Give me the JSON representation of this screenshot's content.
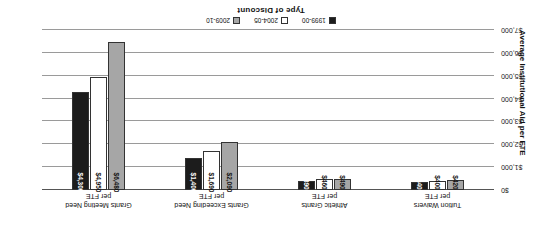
{
  "chart_data": {
    "type": "bar",
    "title": "",
    "xlabel": "Type of Discount",
    "ylabel": "Average Institutional Aid per FTE",
    "orientation": "vertical-grouped",
    "rotated_180": true,
    "grid": true,
    "legend_position": "bottom",
    "ylim": [
      0,
      7000
    ],
    "yticks": [
      0,
      1000,
      2000,
      3000,
      4000,
      5000,
      6000,
      7000
    ],
    "ytick_labels": [
      "$0",
      "$1,000",
      "$2,000",
      "$3,000",
      "$4,000",
      "$5,000",
      "$6,000",
      "$7,000"
    ],
    "categories": [
      "Tuition Waivers\nper FTE",
      "Athletic Grants\nper FTE",
      "Grants Exceeding Need\nper FTE",
      "Grants Meeting Need\nper FTE"
    ],
    "series": [
      {
        "name": "2009-10",
        "color": "#a6a6a6",
        "values": [
          420,
          490,
          2090,
          6480
        ],
        "labels": [
          "$420",
          "$490",
          "$2,090",
          "$6,480"
        ]
      },
      {
        "name": "2004-05",
        "color": "#ffffff",
        "values": [
          400,
          460,
          1690,
          4950
        ],
        "labels": [
          "$400",
          "$460",
          "$1,690",
          "$4,950"
        ]
      },
      {
        "name": "1999-00",
        "color": "#1c1c1c",
        "values": [
          340,
          390,
          1400,
          4300
        ],
        "labels": [
          "$340",
          "$390",
          "$1,400",
          "$4,300"
        ]
      }
    ]
  },
  "axis": {
    "x_title": "Type of Discount",
    "y_title": "Average Institutional Aid per FTE"
  },
  "categories": [
    {
      "line1": "Tuition Waivers",
      "line2": "per FTE"
    },
    {
      "line1": "Athletic Grants",
      "line2": "per FTE"
    },
    {
      "line1": "Grants Exceeding Need",
      "line2": "per FTE"
    },
    {
      "line1": "Grants Meeting Need",
      "line2": "per FTE"
    }
  ],
  "legend": {
    "items": [
      {
        "label": "1999-00",
        "color": "#1c1c1c"
      },
      {
        "label": "2004-05",
        "color": "#ffffff"
      },
      {
        "label": "2009-10",
        "color": "#a6a6a6"
      }
    ]
  },
  "ticks": [
    {
      "label": "$0",
      "value": 0
    },
    {
      "label": "$1,000",
      "value": 1000
    },
    {
      "label": "$2,000",
      "value": 2000
    },
    {
      "label": "$3,000",
      "value": 3000
    },
    {
      "label": "$4,000",
      "value": 4000
    },
    {
      "label": "$5,000",
      "value": 5000
    },
    {
      "label": "$6,000",
      "value": 6000
    },
    {
      "label": "$7,000",
      "value": 7000
    }
  ]
}
